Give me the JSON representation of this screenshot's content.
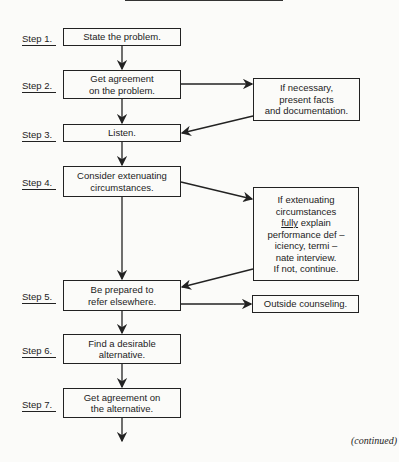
{
  "steps": [
    {
      "label": "Step 1.",
      "text": "State the problem."
    },
    {
      "label": "Step 2.",
      "text": "Get agreement\non the problem."
    },
    {
      "label": "Step 3.",
      "text": "Listen."
    },
    {
      "label": "Step 4.",
      "text": "Consider extenuating\ncircumstances."
    },
    {
      "label": "Step 5.",
      "text": "Be prepared to\nrefer elsewhere."
    },
    {
      "label": "Step 6.",
      "text": "Find a desirable\nalternative."
    },
    {
      "label": "Step 7.",
      "text": "Get agreement on\nthe alternative."
    }
  ],
  "side_boxes": [
    {
      "text": "If necessary,\npresent facts\nand documentation."
    },
    {
      "line1": "If extenuating",
      "line2": "circumstances",
      "underlined": "fully",
      "line3_rest": " explain",
      "line4": "performance def –",
      "line5": "iciency, termi –",
      "line6": "nate interview.",
      "line7": "If not, continue."
    },
    {
      "text": "Outside counseling."
    }
  ],
  "footer": {
    "continued": "(continued)"
  }
}
